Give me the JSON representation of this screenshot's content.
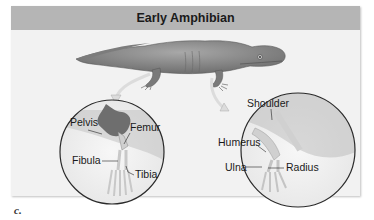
{
  "figure": {
    "title": "Early Amphibian",
    "caption": "c.",
    "colors": {
      "header_bg": "#b5b5b5",
      "panel_bg": "#f2f2f2",
      "body": "#8c8c8c",
      "bone": "#d8d8d8",
      "pelvis": "#6e6e6e"
    }
  },
  "hindlimb_inset": {
    "labels": {
      "pelvis": "Pelvis",
      "femur": "Femur",
      "fibula": "Fibula",
      "tibia": "Tibia"
    }
  },
  "forelimb_inset": {
    "labels": {
      "shoulder": "Shoulder",
      "humerus": "Humerus",
      "ulna": "Ulna",
      "radius": "Radius"
    }
  }
}
